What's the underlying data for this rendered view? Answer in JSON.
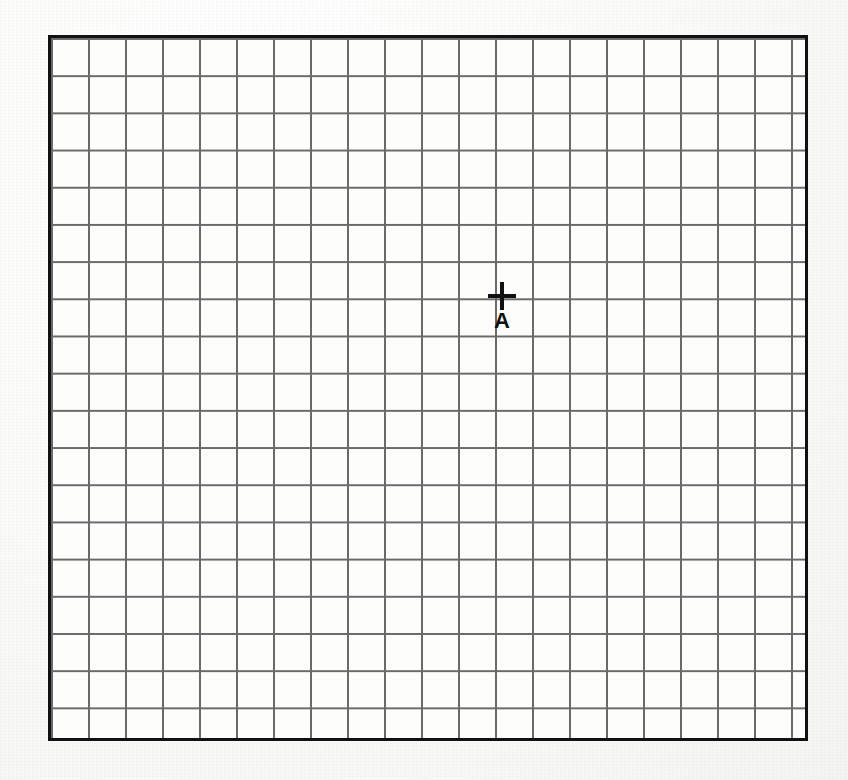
{
  "document": {
    "title": "Graph paper grid with point marker",
    "background_color": "#fbfbfa",
    "sheet_color": "#fdfdfc"
  },
  "grid": {
    "left": 48,
    "top": 35,
    "width": 760,
    "height": 706,
    "cell_width": 37,
    "cell_height": 37.2,
    "columns": 20,
    "rows": 19,
    "line_color": "#6a6a6a",
    "line_width": 1.6,
    "border_color": "#111111",
    "border_width": 3
  },
  "markers": [
    {
      "name": "point-a",
      "label": "A",
      "x": 502,
      "y": 296,
      "grid_column": 12,
      "grid_row": 7,
      "cross_size": 28,
      "cross_thickness": 4,
      "color": "#111111",
      "label_font_size": 22,
      "label_offset_y": 14
    }
  ],
  "chart_data": {
    "type": "scatter",
    "title": "",
    "xlabel": "",
    "ylabel": "",
    "grid": true,
    "legend": "none",
    "x": [
      12.3
    ],
    "y": [
      7.0
    ],
    "labels": [
      "A"
    ],
    "xlim": [
      0,
      20
    ],
    "ylim": [
      0,
      19
    ],
    "tick_labels_x": [],
    "tick_labels_y": [],
    "annotations": [
      "A"
    ]
  }
}
